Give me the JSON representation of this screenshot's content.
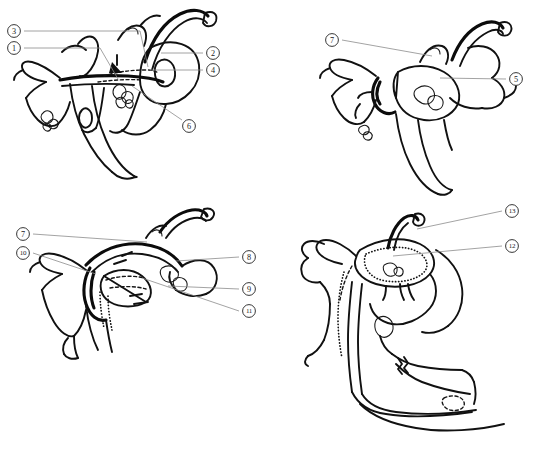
{
  "figure": {
    "background_color": "#ffffff",
    "ink_color": "#111111",
    "leader_line_color": "#8b8b8b",
    "panel_count": 4
  },
  "panels": [
    {
      "id": "I",
      "caption": "I",
      "position": "top-left",
      "labels": [
        {
          "number": "3",
          "display": "3",
          "side": "left",
          "cx": 14,
          "cy": 31,
          "tx": 140,
          "ty": 67
        },
        {
          "number": "1",
          "display": "1",
          "side": "left",
          "cx": 14,
          "cy": 48,
          "tx": 100,
          "ty": 79
        },
        {
          "number": "2",
          "display": "2",
          "side": "right",
          "cx": 213,
          "cy": 53,
          "tx": 161,
          "ty": 53
        },
        {
          "number": "4",
          "display": "4",
          "side": "right",
          "cx": 213,
          "cy": 70,
          "tx": 152,
          "ty": 70
        },
        {
          "number": "6",
          "display": "6",
          "side": "right",
          "cx": 189,
          "cy": 126,
          "tx": 132,
          "ty": 86
        }
      ]
    },
    {
      "id": "II",
      "caption": "II",
      "position": "top-right",
      "labels": [
        {
          "number": "7",
          "display": "7",
          "side": "left",
          "cx": 332,
          "cy": 40,
          "tx": 430,
          "ty": 55
        },
        {
          "number": "5",
          "display": "5",
          "side": "right",
          "cx": 516,
          "cy": 79,
          "tx": 440,
          "ty": 78
        }
      ]
    },
    {
      "id": "III",
      "caption": "III",
      "position": "bottom-left",
      "labels": [
        {
          "number": "7",
          "display": "7",
          "side": "left",
          "cx": 23,
          "cy": 234,
          "tx": 145,
          "ty": 242
        },
        {
          "number": "10",
          "display": "10",
          "side": "left",
          "cx": 23,
          "cy": 253,
          "tx": 95,
          "ty": 273
        },
        {
          "number": "8",
          "display": "8",
          "side": "right",
          "cx": 249,
          "cy": 257,
          "tx": 176,
          "ty": 261
        },
        {
          "number": "9",
          "display": "9",
          "side": "right",
          "cx": 249,
          "cy": 289,
          "tx": 168,
          "ty": 286
        },
        {
          "number": "11",
          "display": "11",
          "side": "right",
          "cx": 249,
          "cy": 311,
          "tx": 142,
          "ty": 278
        }
      ]
    },
    {
      "id": "IV",
      "caption": "IV",
      "position": "bottom-right",
      "labels": [
        {
          "number": "13",
          "display": "13",
          "side": "right",
          "cx": 512,
          "cy": 211,
          "tx": 417,
          "ty": 227
        },
        {
          "number": "12",
          "display": "12",
          "side": "right",
          "cx": 512,
          "cy": 246,
          "tx": 393,
          "ty": 254
        }
      ]
    }
  ],
  "label_numbers_all": [
    "1",
    "2",
    "3",
    "4",
    "5",
    "6",
    "7",
    "8",
    "9",
    "10",
    "11",
    "12",
    "13"
  ]
}
